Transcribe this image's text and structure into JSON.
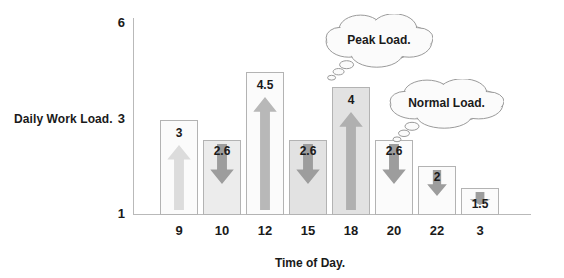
{
  "chart_data": {
    "type": "bar",
    "title": "",
    "xlabel": "Time of Day.",
    "ylabel": "Daily Work Load.",
    "ylim": [
      1,
      6
    ],
    "ytick_labels": [
      "6",
      "3",
      "1"
    ],
    "grid": false,
    "legend": null,
    "categories": [
      "9",
      "10",
      "12",
      "15",
      "18",
      "20",
      "22",
      "3"
    ],
    "values": [
      3,
      2.6,
      4.5,
      2.6,
      4,
      2.6,
      2,
      1.5
    ],
    "value_labels": [
      "3",
      "2.6",
      "4.5",
      "2.6",
      "4",
      "2.6",
      "2",
      "1.5"
    ],
    "trends": [
      "up",
      "down",
      "up",
      "down",
      "up",
      "down",
      "down",
      "down"
    ],
    "annotations": [
      {
        "text": "Peak Load.",
        "points_to": "18"
      },
      {
        "text": "Normal Load.",
        "points_to": "20"
      }
    ]
  },
  "axes": {
    "y_title": "Daily Work Load.",
    "x_title": "Time of Day.",
    "y_ticks": [
      {
        "label": "6",
        "top": 16
      },
      {
        "label": "3",
        "top": 112
      },
      {
        "label": "1",
        "top": 207
      }
    ]
  },
  "bars": [
    {
      "category": "9",
      "value": 3,
      "label": "3",
      "trend": "up",
      "left": 27,
      "width": 38,
      "height": 95,
      "tone": "light",
      "label_pos": "top",
      "arrow_tone": "#dcdcdc"
    },
    {
      "category": "10",
      "value": 2.6,
      "label": "2.6",
      "trend": "down",
      "left": 70,
      "width": 38,
      "height": 75,
      "tone": "mid",
      "label_pos": "inside",
      "arrow_tone": "#9d9d9d"
    },
    {
      "category": "12",
      "value": 4.5,
      "label": "4.5",
      "trend": "up",
      "left": 113,
      "width": 38,
      "height": 143,
      "tone": "light",
      "label_pos": "top",
      "arrow_tone": "#b8b8b8"
    },
    {
      "category": "15",
      "value": 2.6,
      "label": "2.6",
      "trend": "down",
      "left": 156,
      "width": 38,
      "height": 75,
      "tone": "dark",
      "label_pos": "inside",
      "arrow_tone": "#9d9d9d"
    },
    {
      "category": "18",
      "value": 4,
      "label": "4",
      "trend": "up",
      "left": 199,
      "width": 38,
      "height": 128,
      "tone": "dark",
      "label_pos": "top",
      "arrow_tone": "#b0b0b0"
    },
    {
      "category": "20",
      "value": 2.6,
      "label": "2.6",
      "trend": "down",
      "left": 242,
      "width": 38,
      "height": 75,
      "tone": "light",
      "label_pos": "inside",
      "arrow_tone": "#9d9d9d"
    },
    {
      "category": "22",
      "value": 2,
      "label": "2",
      "trend": "down",
      "left": 285,
      "width": 38,
      "height": 49,
      "tone": "light",
      "label_pos": "inside",
      "arrow_tone": "#9d9d9d"
    },
    {
      "category": "3",
      "value": 1.5,
      "label": "1.5",
      "trend": "down",
      "left": 328,
      "width": 38,
      "height": 27,
      "tone": "light",
      "label_pos": "below",
      "arrow_tone": "#9d9d9d"
    }
  ],
  "bubbles": [
    {
      "text": "Peak Load.",
      "left": 325,
      "top": 14,
      "width": 108,
      "height": 52
    },
    {
      "text": "Normal Load.",
      "left": 389,
      "top": 79,
      "width": 115,
      "height": 48
    }
  ]
}
